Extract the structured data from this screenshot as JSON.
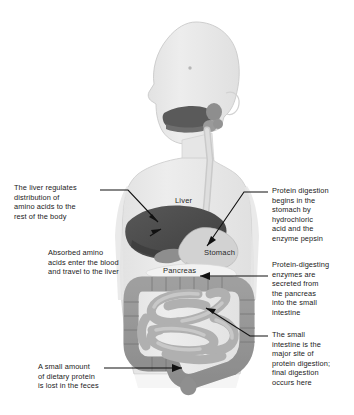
{
  "figure": {
    "background_color": "#ffffff",
    "width": 354,
    "height": 415
  },
  "body_figure": {
    "silhouette_color": "#e8e8e8",
    "silhouette_outline": "#cfcfcf",
    "description": "Grey human body silhouette, head shown in left-facing profile, torso with digestive organs"
  },
  "organ_labels": [
    {
      "id": "liver",
      "text": "Liver"
    },
    {
      "id": "stomach",
      "text": "Stomach"
    },
    {
      "id": "pancreas",
      "text": "Pancreas"
    }
  ],
  "organs": {
    "liver": {
      "name": "Liver",
      "color": "#4f4f4f"
    },
    "gallbladder": {
      "name": "Gallbladder",
      "color": "#8e8e8e"
    },
    "stomach": {
      "name": "Stomach",
      "color": "#cfcfcf"
    },
    "pancreas": {
      "name": "Pancreas",
      "color": "#efefef"
    },
    "large_intestine": {
      "name": "Large intestine",
      "color": "#9a9a9a"
    },
    "small_intestine": {
      "name": "Small intestine",
      "color": "#b4b4b4"
    },
    "esophagus": {
      "name": "Esophagus",
      "color": "#d6d6d6"
    },
    "mouth": {
      "name": "Mouth and tongue",
      "color": "#5a5a5a"
    },
    "salivary_glands": {
      "name": "Salivary glands",
      "color": "#8a8a8a"
    }
  },
  "annotations": {
    "liver_regulates": {
      "text": "The liver regulates\ndistribution of\namino acids to the\nrest of the body",
      "side": "left"
    },
    "absorbed_amino": {
      "text": "Absorbed amino\nacids enter the blood\nand travel to the liver",
      "side": "left"
    },
    "feces_loss": {
      "text": "A small amount\nof dietary protein\nis lost in the feces",
      "side": "left"
    },
    "stomach_digestion": {
      "text": "Protein digestion\nbegins in the\nstomach by\nhydrochloric\nacid and the\nenzyme pepsin",
      "side": "right"
    },
    "pancreas_enzymes": {
      "text": "Protein-digesting\nenzymes are\nsecreted from\nthe pancreas\ninto the small\nintestine",
      "side": "right"
    },
    "small_intestine_site": {
      "text": "The small\nintestine is the\nmajor site of\nprotein digestion;\nfinal digestion\noccurs here",
      "side": "right"
    }
  },
  "leader_lines": {
    "color": "#111111",
    "count": 6
  }
}
